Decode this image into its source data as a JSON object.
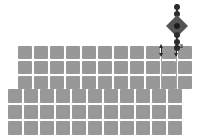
{
  "figure": {
    "type": "lattice-particle-schematic",
    "background_color": "#ffffff",
    "cell_color": "#989898",
    "gap_color": "#ffffff",
    "particle_color": "#555555",
    "bead_color": "#2b2b2b",
    "annotation_color": "#1a1a1a"
  },
  "lattice": {
    "upper_band": {
      "name": "upper-lattice-band",
      "columns": 11,
      "rows": 3,
      "cell_width": 14,
      "cell_height": 13,
      "gap": 2,
      "origin_x": 18,
      "origin_y": 46
    },
    "lower_band": {
      "name": "lower-lattice-band",
      "columns": 11,
      "rows": 3,
      "cell_width": 14,
      "cell_height": 14,
      "gap": 2,
      "origin_x": 8,
      "origin_y": 89
    }
  },
  "particle": {
    "name": "suspended-diamond-particle",
    "shape": "diamond",
    "beads_above": 2,
    "beads_below": 3,
    "tether": "vertical-bead-chain"
  },
  "annotations": {
    "lattice_constant_label": "a",
    "arrow_left_name": "dimension-arrow-left",
    "arrow_right_name": "dimension-arrow-right"
  }
}
